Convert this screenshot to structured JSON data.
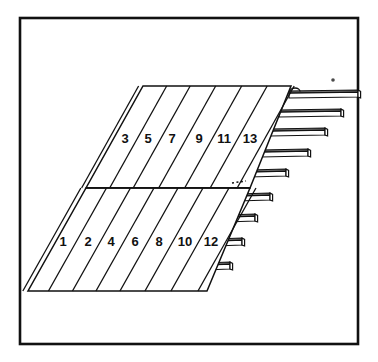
{
  "figure": {
    "kind": "technical-line-drawing",
    "background_color": "#ffffff",
    "line_color": "#111111",
    "fill_color": "#ffffff",
    "shade_color": "#6f6f6f"
  },
  "frame": {
    "name": "outer-border",
    "x": 20,
    "y": 18,
    "width": 338,
    "height": 326,
    "stroke_width": 2.6,
    "stroke_color": "#111111"
  },
  "panel": {
    "name": "skewed-panel",
    "top_left_x": 143,
    "top_y": 86,
    "bottom_left_x": 28,
    "bottom_y": 291,
    "top_right_x": 291,
    "bottom_right_x": 207,
    "mid_y": 188,
    "mid_left_x": 86,
    "mid_right_x": 250,
    "stroke_width": 1.5
  },
  "upper_row": {
    "name": "upper-strip-row",
    "labels": [
      "3",
      "5",
      "7",
      "9",
      "11",
      "13"
    ],
    "label_y": 140,
    "label_xs": [
      125,
      148,
      172,
      199,
      224,
      250
    ]
  },
  "lower_row": {
    "name": "lower-strip-row",
    "labels": [
      "1",
      "2",
      "4",
      "6",
      "8",
      "10",
      "12"
    ],
    "label_y": 243,
    "label_xs": [
      63,
      88,
      111,
      135,
      159,
      185,
      211
    ]
  },
  "divider": {
    "name": "mid-divider-line",
    "visible": true,
    "dash_detail": true,
    "dash_x": 232,
    "dash_y": 183
  },
  "fingers": {
    "name": "protruding-finger-bars",
    "count": 9,
    "thickness": 7,
    "depth": 4,
    "items": [
      {
        "index": 1,
        "base_x": 289,
        "y": 91,
        "length": 69
      },
      {
        "index": 2,
        "base_x": 279,
        "y": 110,
        "length": 62
      },
      {
        "index": 3,
        "base_x": 270,
        "y": 129,
        "length": 55
      },
      {
        "index": 4,
        "base_x": 261,
        "y": 150,
        "length": 47
      },
      {
        "index": 5,
        "base_x": 249,
        "y": 170,
        "length": 37
      },
      {
        "index": 6,
        "base_x": 237,
        "y": 194,
        "length": 33
      },
      {
        "index": 7,
        "base_x": 226,
        "y": 215,
        "length": 29
      },
      {
        "index": 8,
        "base_x": 215,
        "y": 239,
        "length": 27
      },
      {
        "index": 9,
        "base_x": 204,
        "y": 263,
        "length": 26
      }
    ]
  },
  "loop_detail": {
    "name": "top-loop-tab",
    "cx": 295,
    "cy": 88,
    "rx": 5,
    "ry": 3.5
  },
  "speck": {
    "name": "scan-speck",
    "cx": 333,
    "cy": 80,
    "r": 1.8
  }
}
